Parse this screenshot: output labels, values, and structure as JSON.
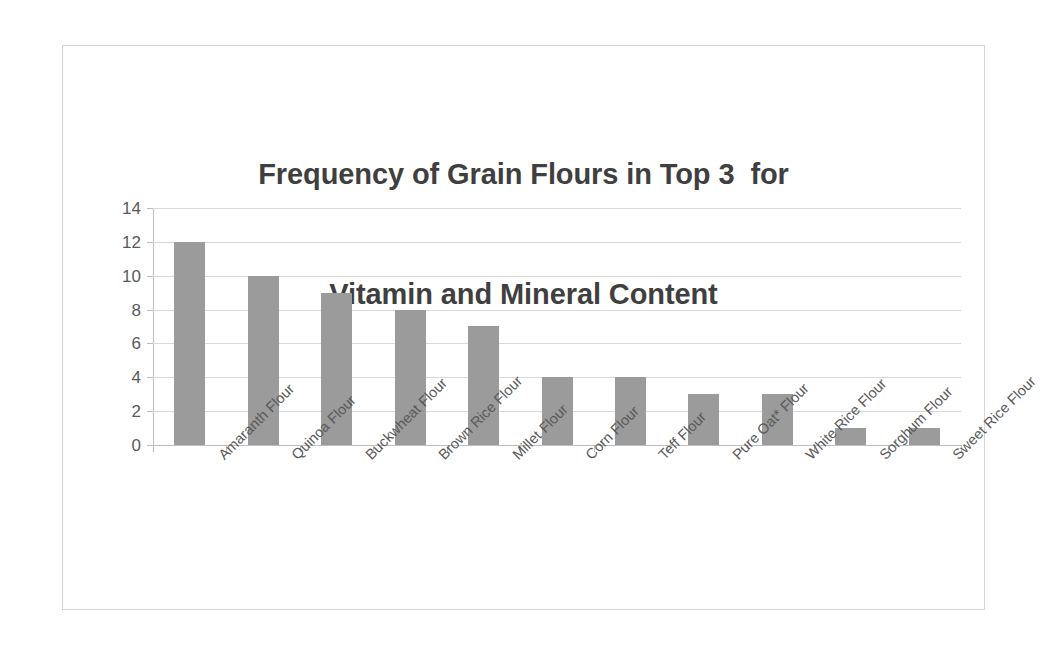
{
  "chart_data": {
    "type": "bar",
    "title": "Frequency of Grain Flours in Top 3  for Vitamin and Mineral Content",
    "title_line1": "Frequency of Grain Flours in Top 3  for",
    "title_line2": "Vitamin and Mineral Content",
    "xlabel": "",
    "ylabel": "",
    "ylim": [
      0,
      14
    ],
    "ytick_step": 2,
    "ytick_labels": [
      "14",
      "12",
      "10",
      "8",
      "6",
      "4",
      "2",
      "0"
    ],
    "ytick_values": [
      14,
      12,
      10,
      8,
      6,
      4,
      2,
      0
    ],
    "grid": true,
    "legend": false,
    "legend_position": "none",
    "bar_color": "#9b9b9b",
    "title_color": "#3f3f3f",
    "tick_label_color": "#595959",
    "gridline_color": "#d9d9d9",
    "axis_color": "#bfbfbf",
    "frame_border_color": "#d4d4d4",
    "background_color": "#ffffff",
    "categories": [
      "Amaranth Flour",
      "Quinoa Flour",
      "Buckwheat Flour",
      "Brown Rice Flour",
      "Millet Flour",
      "Corn Flour",
      "Teff Flour",
      "Pure Oat* Flour",
      "White Rice Flour",
      "Sorghum Flour",
      "Sweet Rice Flour"
    ],
    "values": [
      12,
      10,
      9,
      8,
      7,
      4,
      4,
      3,
      3,
      1,
      1
    ]
  }
}
